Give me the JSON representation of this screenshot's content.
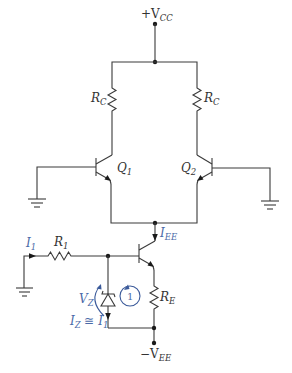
{
  "diagram": {
    "colors": {
      "wire": "#3a3a3a",
      "annotation": "#4a6aa8"
    },
    "labels": {
      "vcc": {
        "prefix": "+V",
        "sub": "CC"
      },
      "rc_left": {
        "main": "R",
        "sub": "C"
      },
      "rc_right": {
        "main": "R",
        "sub": "C"
      },
      "q1": {
        "main": "Q",
        "sub": "1"
      },
      "q2": {
        "main": "Q",
        "sub": "2"
      },
      "iee": {
        "main": "I",
        "sub": "EE"
      },
      "i1": {
        "main": "I",
        "sub": "1"
      },
      "r1": {
        "main": "R",
        "sub": "1"
      },
      "vz": {
        "main": "V",
        "sub": "Z"
      },
      "loop": "1",
      "re": {
        "main": "R",
        "sub": "E"
      },
      "iz": {
        "main": "I",
        "sub": "Z",
        "rel": " ≅ ",
        "rhs": "I",
        "rhs_sub": "1"
      },
      "vee": {
        "prefix": "−V",
        "sub": "EE"
      }
    },
    "components": [
      {
        "id": "RC1",
        "type": "resistor",
        "label": "R_C"
      },
      {
        "id": "RC2",
        "type": "resistor",
        "label": "R_C"
      },
      {
        "id": "Q1",
        "type": "npn-transistor",
        "label": "Q_1"
      },
      {
        "id": "Q2",
        "type": "npn-transistor",
        "label": "Q_2"
      },
      {
        "id": "Q3",
        "type": "npn-transistor",
        "label": ""
      },
      {
        "id": "R1",
        "type": "resistor",
        "label": "R_1"
      },
      {
        "id": "RE",
        "type": "resistor",
        "label": "R_E"
      },
      {
        "id": "DZ",
        "type": "zener-diode",
        "label": "V_Z"
      }
    ]
  }
}
